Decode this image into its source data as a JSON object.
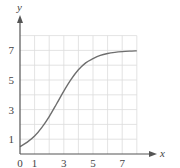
{
  "chart_data": {
    "type": "line",
    "title": "",
    "xlabel": "x",
    "ylabel": "y",
    "xlim": [
      0,
      8
    ],
    "ylim": [
      0,
      8
    ],
    "grid": true,
    "x_ticks": [
      0,
      1,
      3,
      5,
      7
    ],
    "y_ticks": [
      1,
      3,
      5,
      7
    ],
    "x_tick_labels": [
      "0",
      "1",
      "3",
      "5",
      "7"
    ],
    "y_tick_labels": [
      "1",
      "3",
      "5",
      "7"
    ],
    "series": [
      {
        "name": "logistic curve",
        "x": [
          0,
          0.5,
          1,
          1.5,
          2,
          2.5,
          3,
          3.5,
          4,
          4.5,
          5,
          5.5,
          6,
          6.5,
          7,
          7.5,
          8
        ],
        "y": [
          0.5,
          0.8,
          1.21,
          1.8,
          2.53,
          3.38,
          4.25,
          5.04,
          5.69,
          6.16,
          6.44,
          6.66,
          6.79,
          6.87,
          6.92,
          6.95,
          6.97
        ]
      }
    ]
  }
}
